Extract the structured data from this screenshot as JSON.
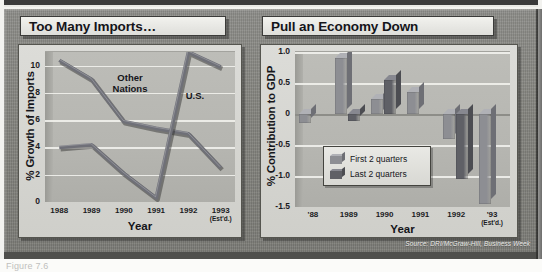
{
  "figure": {
    "source_note": "Source: DRI/McGraw-Hill, Business Week",
    "caption_partial": "Figure 7.6",
    "colors": {
      "plate": "#85857f",
      "panel_title_bg": "#eaeae6",
      "plot_bg": "#b6b6b1",
      "gridline": "#f0f0ec",
      "series_other_nations": "#6f7078",
      "series_us": "#6f7078",
      "bar_first_2_quarters": "#8d8e93",
      "bar_last_2_quarters": "#5f6066",
      "ink": "#15151a"
    }
  },
  "chart_data": [
    {
      "type": "line",
      "title": "Too Many Imports…",
      "xlabel": "Year",
      "ylabel": "% Growth of Imports",
      "ylim": [
        0,
        11
      ],
      "yticks": [
        0,
        2,
        4,
        6,
        8,
        10
      ],
      "ytick_labels": [
        "0",
        "2",
        "4",
        "6",
        "8",
        "10"
      ],
      "grid": true,
      "x": [
        "1988",
        "1989",
        "1990",
        "1991",
        "1992",
        "1993"
      ],
      "xtick_labels": [
        "1988",
        "1989",
        "1990",
        "1991",
        "1992",
        "1993"
      ],
      "xtick_sublabels": [
        "",
        "",
        "",
        "",
        "",
        "(Est'd.)"
      ],
      "series": [
        {
          "name": "Other Nations",
          "values": [
            10.4,
            9.0,
            5.9,
            5.4,
            5.0,
            2.5
          ],
          "label_position": "upper-center"
        },
        {
          "name": "U.S.",
          "values": [
            4.0,
            4.2,
            2.1,
            0.3,
            11.0,
            9.9
          ],
          "label_position": "upper-right"
        }
      ]
    },
    {
      "type": "bar",
      "title": "Pull an Economy Down",
      "xlabel": "Year",
      "ylabel": "% Contribution to GDP",
      "ylim": [
        -1.5,
        1.0
      ],
      "yticks": [
        1.0,
        0.5,
        0,
        -0.5,
        -1.0,
        -1.5
      ],
      "ytick_labels": [
        "1.0",
        "0.5",
        "0",
        "-0.5",
        "-1.0",
        "-1.5"
      ],
      "grid": true,
      "categories": [
        "'88",
        "1989",
        "1990",
        "1991",
        "1992",
        "'93"
      ],
      "xtick_sublabels": [
        "",
        "",
        "",
        "",
        "",
        "(Est'd.)"
      ],
      "legend_position": "lower-left",
      "series": [
        {
          "name": "First 2 quarters",
          "values": [
            -0.15,
            0.9,
            0.25,
            0.35,
            -0.4,
            -1.45
          ]
        },
        {
          "name": "Last 2 quarters",
          "values": [
            0,
            -0.12,
            0.55,
            0,
            -1.05,
            0
          ]
        }
      ]
    }
  ]
}
